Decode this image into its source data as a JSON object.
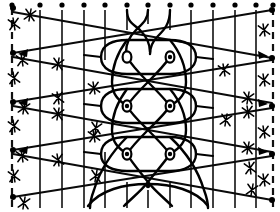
{
  "figure": {
    "type": "knot-braid-diagram",
    "width": 280,
    "height": 212,
    "background_color": "#ffffff",
    "ink_color": "#000000",
    "caption": ""
  },
  "geometry": {
    "vertical_lines": [
      {
        "id": "v0",
        "x": 12,
        "style": "dashed",
        "top": 8,
        "bottom": 208
      },
      {
        "id": "v1",
        "x": 40,
        "style": "solid",
        "top": 10,
        "bottom": 208
      },
      {
        "id": "v2",
        "x": 62,
        "style": "solid",
        "top": 10,
        "bottom": 208
      },
      {
        "id": "v3",
        "x": 84,
        "style": "solid",
        "top": 10,
        "bottom": 208
      },
      {
        "id": "v4",
        "x": 105,
        "style": "solid",
        "top": 10,
        "bottom": 208
      },
      {
        "id": "v5",
        "x": 127,
        "style": "solid",
        "top": 10,
        "bottom": 208
      },
      {
        "id": "v6",
        "x": 148,
        "style": "solid",
        "top": 10,
        "bottom": 208
      },
      {
        "id": "v7",
        "x": 170,
        "style": "solid",
        "top": 10,
        "bottom": 208
      },
      {
        "id": "v8",
        "x": 191,
        "style": "solid",
        "top": 10,
        "bottom": 208
      },
      {
        "id": "v9",
        "x": 213,
        "style": "solid",
        "top": 10,
        "bottom": 208
      },
      {
        "id": "v10",
        "x": 235,
        "style": "solid",
        "top": 10,
        "bottom": 208
      },
      {
        "id": "v11",
        "x": 256,
        "style": "solid",
        "top": 10,
        "bottom": 208
      },
      {
        "id": "v12",
        "x": 273,
        "style": "dashed",
        "top": 8,
        "bottom": 208
      }
    ],
    "top_dots": [
      {
        "x": 12,
        "y": 5
      },
      {
        "x": 40,
        "y": 5
      },
      {
        "x": 62,
        "y": 5
      },
      {
        "x": 84,
        "y": 5
      },
      {
        "x": 105,
        "y": 5
      },
      {
        "x": 127,
        "y": 5
      },
      {
        "x": 148,
        "y": 5
      },
      {
        "x": 170,
        "y": 5
      },
      {
        "x": 191,
        "y": 5
      },
      {
        "x": 213,
        "y": 5
      },
      {
        "x": 235,
        "y": 5
      },
      {
        "x": 256,
        "y": 5
      },
      {
        "x": 273,
        "y": 5
      }
    ],
    "left_nodes": [
      {
        "x": 13,
        "y": 8
      },
      {
        "x": 13,
        "y": 53
      },
      {
        "x": 13,
        "y": 102
      },
      {
        "x": 13,
        "y": 150
      },
      {
        "x": 13,
        "y": 197
      }
    ],
    "right_nodes": [
      {
        "x": 272,
        "y": 8
      },
      {
        "x": 272,
        "y": 57
      },
      {
        "x": 272,
        "y": 106
      },
      {
        "x": 272,
        "y": 154
      },
      {
        "x": 272,
        "y": 200
      }
    ],
    "diagonals": [
      {
        "id": "d1",
        "x1": 13,
        "y1": 12,
        "x2": 272,
        "y2": 58,
        "ticks": 3,
        "arrow": "right"
      },
      {
        "id": "d2",
        "x1": 13,
        "y1": 53,
        "x2": 272,
        "y2": 10,
        "ticks": 3,
        "arrow": "right"
      },
      {
        "id": "d3",
        "x1": 13,
        "y1": 57,
        "x2": 272,
        "y2": 103,
        "ticks": 3,
        "arrow": "right"
      },
      {
        "id": "d4",
        "x1": 13,
        "y1": 102,
        "x2": 272,
        "y2": 60,
        "ticks": 3,
        "arrow": "right"
      },
      {
        "id": "d5",
        "x1": 13,
        "y1": 106,
        "x2": 272,
        "y2": 152,
        "ticks": 3,
        "arrow": "right"
      },
      {
        "id": "d6",
        "x1": 13,
        "y1": 150,
        "x2": 272,
        "y2": 108,
        "ticks": 3,
        "arrow": "right"
      },
      {
        "id": "d7",
        "x1": 13,
        "y1": 154,
        "x2": 272,
        "y2": 200,
        "ticks": 3,
        "arrow": "right"
      },
      {
        "id": "d8",
        "x1": 13,
        "y1": 197,
        "x2": 272,
        "y2": 156,
        "ticks": 3,
        "arrow": "right"
      }
    ],
    "braid_column": {
      "center_x": 148,
      "left_lobe_x": 127,
      "right_lobe_x": 170,
      "lens_rows": [
        {
          "y": 57,
          "nodes": [
            {
              "x": 127,
              "y": 57
            },
            {
              "x": 170,
              "y": 57
            }
          ]
        },
        {
          "y": 106,
          "nodes": [
            {
              "x": 127,
              "y": 106
            },
            {
              "x": 170,
              "y": 106
            }
          ]
        },
        {
          "y": 154,
          "nodes": [
            {
              "x": 127,
              "y": 154
            },
            {
              "x": 170,
              "y": 154
            }
          ]
        }
      ],
      "crossing_rows": [
        {
          "y": 30
        },
        {
          "y": 82
        },
        {
          "y": 130
        },
        {
          "y": 182
        }
      ]
    }
  },
  "labels": {
    "axis_label": "",
    "annotations": []
  }
}
